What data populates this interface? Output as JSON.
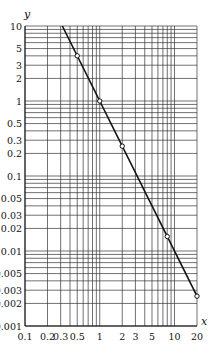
{
  "chart_data": {
    "type": "line",
    "title": "",
    "xlabel": "x",
    "ylabel": "y",
    "xscale": "log",
    "yscale": "log",
    "xlim": [
      0.1,
      20
    ],
    "ylim": [
      0.001,
      10
    ],
    "grid": true,
    "legend": null,
    "x_ticks": [
      0.1,
      0.2,
      0.3,
      0.5,
      1,
      2,
      3,
      5,
      10,
      20
    ],
    "x_tick_labels": [
      "0.1",
      "0.2",
      "0.3",
      "0.5",
      "1",
      "2",
      "3",
      "5",
      "10",
      "20"
    ],
    "y_ticks": [
      10,
      5,
      3,
      2,
      1,
      0.5,
      0.3,
      0.2,
      0.1,
      0.05,
      0.03,
      0.02,
      0.01,
      0.005,
      0.003,
      0.002,
      0.001
    ],
    "y_tick_labels": [
      "10",
      "5",
      "3",
      "2",
      "1",
      "0.5",
      "0.3",
      "0.2",
      "0.1",
      "0.05",
      "0.03",
      "0.02",
      "0.01",
      "0.005",
      "0.003",
      "0.002",
      "0.001"
    ],
    "series": [
      {
        "name": "y = 1/x^2",
        "line": {
          "x": [
            0.316,
            20
          ],
          "y": [
            10,
            0.0025
          ]
        },
        "markers": {
          "x": [
            0.5,
            1,
            2,
            8,
            20
          ],
          "y": [
            4,
            1,
            0.25,
            0.0156,
            0.0025
          ]
        },
        "color": "#111111",
        "marker": "open-circle"
      }
    ]
  },
  "colors": {
    "line": "#111111",
    "grid": "#333333",
    "background": "#ffffff"
  }
}
